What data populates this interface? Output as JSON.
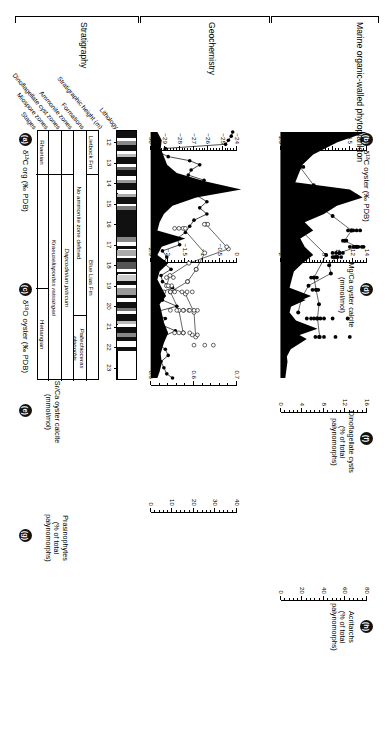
{
  "figure": {
    "groups": [
      {
        "id": "stratigraphy",
        "label": "Stratigraphy"
      },
      {
        "id": "geochemistry",
        "label": "Geochemistry"
      },
      {
        "id": "phytoplankton",
        "label": "Marine organic-walled phytoplankton"
      }
    ],
    "column_headers": [
      "Stages",
      "Miospore zones",
      "Dinoflagellate cyst zones",
      "Ammonite zones",
      "Formations",
      "Stratigraphic height (m)",
      "Lithology"
    ],
    "stratigraphy_table": {
      "rows": [
        {
          "name": "formations",
          "cells": [
            {
              "label": "Lietbock Fm",
              "italic": false,
              "span": [
                0,
                0.175
              ]
            },
            {
              "label": "Blue Lias Fm",
              "italic": false,
              "span": [
                0.175,
                1.0
              ]
            }
          ]
        },
        {
          "name": "ammonite-zones",
          "cells": [
            {
              "label": "No ammonite zone defined",
              "italic": false,
              "span": [
                0,
                0.74
              ]
            },
            {
              "label": "Paltechioceras planorbis",
              "italic": true,
              "span": [
                0.74,
                1.0
              ]
            }
          ]
        },
        {
          "name": "dinoflagellate-cyst-zones",
          "cells": [
            {
              "label": "",
              "italic": false,
              "span": [
                0,
                0.175
              ]
            },
            {
              "label": "Dapcodinium priscum",
              "italic": true,
              "span": [
                0.175,
                1.0
              ]
            }
          ]
        },
        {
          "name": "miospore-zones",
          "cells": [
            {
              "label": "",
              "italic": false,
              "span": [
                0,
                0.175
              ]
            },
            {
              "label": "Kraeuselisporites reissingeri",
              "italic": true,
              "span": [
                0.175,
                1.0
              ]
            }
          ]
        },
        {
          "name": "stages",
          "cells": [
            {
              "label": "Rhaetian",
              "italic": false,
              "span": [
                0,
                0.175
              ]
            },
            {
              "label": "",
              "italic": false,
              "span": [
                0.175,
                0.63
              ]
            },
            {
              "label": "Hettangian",
              "italic": false,
              "span": [
                0.63,
                1.0
              ]
            }
          ]
        }
      ]
    },
    "height_axis": {
      "label": "Stratigraphic height (m)",
      "ticks": [
        12,
        13,
        14,
        15,
        16,
        17,
        18,
        19,
        20,
        21,
        22,
        23
      ],
      "min": 11.4,
      "max": 23.6
    },
    "panels": [
      {
        "key": "a",
        "letter": "a",
        "title": [
          "δ¹³ C",
          "org",
          "(‰ PDB)"
        ],
        "title_plain": "δ¹³C org (‰ PDB)",
        "ticks": [
          -30,
          -29,
          -28,
          -27,
          -26,
          -25,
          -24
        ],
        "tick_labels": [
          "−30",
          "−29",
          "−28",
          "−27",
          "−26",
          "−25",
          "−24"
        ],
        "style": "line-filled"
      },
      {
        "key": "b",
        "letter": "b",
        "title": [
          "δ¹³ C",
          "oyster",
          "(‰ PDB)"
        ],
        "title_plain": "δ¹³C oyster (‰ PDB)",
        "ticks": [
          1.5,
          2,
          2.5,
          3,
          3.5,
          4
        ],
        "tick_labels": [
          "1.5",
          "2",
          "2.5",
          "3",
          "3.5",
          "4"
        ],
        "style": "line-filled"
      },
      {
        "key": "c",
        "letter": "c",
        "title": [
          "δ¹⁸ O",
          "oyster",
          "(‰ PDB)"
        ],
        "title_plain": "δ¹⁸O oyster (‰ PDB)",
        "ticks": [
          0,
          -0.5,
          -1,
          -1.5,
          -2,
          -2.5
        ],
        "tick_labels": [
          "0",
          "−0.5",
          "−1",
          "−1.5",
          "−2",
          "−2.5"
        ],
        "style": "line-open"
      },
      {
        "key": "d",
        "letter": "d",
        "title": [
          "Mg/Ca oyster calcite",
          "(mmol/mol)"
        ],
        "title_plain": "Mg/Ca oyster calcite (mmol/mol)",
        "ticks": [
          2,
          4,
          6,
          8,
          10,
          12,
          14
        ],
        "tick_labels": [
          "2",
          "4",
          "6",
          "8",
          "10",
          "12",
          "14"
        ],
        "style": "line-filled"
      },
      {
        "key": "e",
        "letter": "e",
        "title": [
          "Sr/Ca oyster calcite",
          "(mmol/mol)"
        ],
        "title_plain": "Sr/Ca oyster calcite (mmol/mol)",
        "ticks": [
          0.5,
          0.6,
          0.7
        ],
        "tick_labels": [
          "0.5",
          "0.6",
          "0.7"
        ],
        "style": "line-open"
      },
      {
        "key": "f",
        "letter": "f",
        "title": [
          "Dinoflagellate cysts",
          "(% of total",
          "palynomorphs)"
        ],
        "title_plain": "Dinoflagellate cysts (% of total palynomorphs)",
        "ticks": [
          0,
          4,
          8,
          12,
          16
        ],
        "tick_labels": [
          "0",
          "4",
          "8",
          "12",
          "16"
        ],
        "style": "area"
      },
      {
        "key": "g",
        "letter": "g",
        "title": [
          "Prasinophytes",
          "(% of total",
          "palynomorphs)"
        ],
        "title_plain": "Prasinophytes (% of total palynomorphs)",
        "ticks": [
          0,
          10,
          20,
          30,
          40
        ],
        "tick_labels": [
          "0",
          "10",
          "20",
          "30",
          "40"
        ],
        "style": "area"
      },
      {
        "key": "h",
        "letter": "h",
        "title": [
          "Acritarchs",
          "(% of total",
          "palynomorphs)"
        ],
        "title_plain": "Acritarchs (% of total palynomorphs)",
        "ticks": [
          0,
          20,
          40,
          60,
          80
        ],
        "tick_labels": [
          "0",
          "20",
          "40",
          "60",
          "80"
        ],
        "style": "area"
      }
    ]
  },
  "chart_data": [
    {
      "id": "a",
      "type": "line",
      "title": "δ¹³C org (‰ PDB)",
      "xlabel": "Stratigraphic height (m)",
      "ylabel": "δ¹³C org (‰ PDB)",
      "ylim": [
        -30,
        -23.6
      ],
      "xlim": [
        11.4,
        23.6
      ],
      "marker": "filled-circle",
      "x": [
        11.5,
        11.7,
        11.9,
        12.1,
        12.3,
        12.5,
        12.7,
        12.9,
        13.1,
        13.35,
        13.6,
        13.85,
        14.1,
        14.35,
        14.6,
        14.9,
        15.2,
        15.5,
        15.8,
        16.1,
        16.4,
        16.7,
        17.0,
        17.3,
        17.6,
        17.9,
        18.2,
        18.5,
        18.8,
        19.1,
        19.4,
        19.7,
        20.0,
        20.3,
        20.6,
        20.9,
        21.2,
        21.5,
        21.8,
        22.1,
        22.4,
        22.7,
        23.0,
        23.3,
        23.5
      ],
      "y": [
        -24.3,
        -24.4,
        -24.6,
        -24.8,
        -29.0,
        -29.4,
        -28.8,
        -27.3,
        -26.6,
        -27.2,
        -27.4,
        -26.3,
        -26.7,
        -26.2,
        -26.8,
        -26.1,
        -26.6,
        -26.1,
        -27.0,
        -27.3,
        -27.6,
        -28.2,
        -28.0,
        -29.2,
        -28.9,
        -29.1,
        -28.6,
        -29.3,
        -29.2,
        -28.5,
        -29.6,
        -29.2,
        -28.2,
        -29.8,
        -29.0,
        -29.3,
        -28.3,
        -29.2,
        -29.6,
        -29.0,
        -28.8,
        -29.3,
        -29.1,
        -28.9,
        -28.5
      ]
    },
    {
      "id": "b",
      "type": "scatter-line",
      "title": "δ¹³C oyster (‰ PDB)",
      "ylabel": "δ¹³C oyster (‰ PDB)",
      "xlim": [
        11.4,
        23.6
      ],
      "ylim": [
        1.5,
        4.1
      ],
      "marker": "filled-circle",
      "series_line": {
        "x": [
          12.0,
          13.2,
          14.1,
          15.0,
          15.6,
          16.3,
          16.8,
          17.1,
          17.4,
          17.6,
          18.0,
          18.4,
          19.0,
          19.6,
          20.3
        ],
        "y": [
          2.6,
          2.05,
          2.45,
          2.5,
          3.0,
          3.55,
          3.35,
          3.7,
          3.2,
          3.1,
          2.9,
          2.95,
          2.3,
          2.1,
          2.0
        ]
      },
      "scatter": {
        "x": [
          12.0,
          12.0,
          13.2,
          13.2,
          16.3,
          16.3,
          16.3,
          16.3,
          16.3,
          16.8,
          16.8,
          17.1,
          17.1,
          17.1,
          17.1,
          17.1,
          17.1,
          17.1,
          17.4,
          17.4,
          17.4,
          17.4,
          17.6,
          17.6,
          17.6,
          17.6
        ],
        "y": [
          2.55,
          2.7,
          2.0,
          2.15,
          3.45,
          3.55,
          3.6,
          3.7,
          3.8,
          3.3,
          3.4,
          3.5,
          3.6,
          3.65,
          3.7,
          3.75,
          3.85,
          3.9,
          3.0,
          3.1,
          3.2,
          3.3,
          3.0,
          3.05,
          3.15,
          3.25
        ]
      }
    },
    {
      "id": "c",
      "type": "scatter-line",
      "title": "δ¹⁸O oyster (‰ PDB)",
      "ylabel": "δ¹⁸O oyster (‰ PDB)",
      "xlim": [
        11.4,
        23.6
      ],
      "ylim": [
        -2.6,
        0.1
      ],
      "marker": "open-circle",
      "series_line": {
        "x": [
          16.0,
          17.2,
          17.9,
          18.5,
          19.0,
          19.4,
          20.3,
          21.5
        ],
        "y": [
          -0.9,
          -0.25,
          -1.4,
          -1.95,
          -2.05,
          -1.5,
          -1.25,
          -1.2
        ]
      },
      "scatter": {
        "x": [
          21.4,
          21.4,
          20.2,
          20.2,
          20.2,
          20.2,
          19.3,
          19.3,
          19.3,
          19.0,
          19.0,
          18.6,
          18.6,
          17.1,
          16.0,
          16.0
        ],
        "y": [
          -1.15,
          -1.3,
          -1.15,
          -1.25,
          -1.4,
          -1.55,
          -1.3,
          -1.45,
          -1.6,
          -1.9,
          -2.0,
          -1.85,
          -2.05,
          -0.3,
          -0.85,
          -0.95
        ]
      }
    },
    {
      "id": "d",
      "type": "scatter-line",
      "title": "Mg/Ca oyster calcite (mmol/mol)",
      "ylabel": "Mg/Ca oyster calcite (mmol/mol)",
      "xlim": [
        11.4,
        23.6
      ],
      "ylim": [
        1.6,
        14.6
      ],
      "marker": "filled-circle",
      "series_line": {
        "x": [
          16.1,
          17.5,
          18.6,
          19.2,
          19.9,
          20.6,
          21.5
        ],
        "y": [
          4.2,
          8.3,
          6.6,
          6.9,
          7.3,
          7.1,
          7.4
        ]
      },
      "scatter": {
        "x": [
          16.1,
          16.1,
          18.6,
          18.6,
          18.6,
          19.2,
          19.2,
          19.2,
          20.6,
          20.6,
          20.6,
          20.6,
          20.6,
          20.6,
          20.6,
          20.6,
          21.5,
          21.5,
          21.5,
          21.5,
          21.5
        ],
        "y": [
          4.0,
          4.4,
          6.2,
          6.6,
          7.0,
          6.4,
          6.9,
          7.2,
          5.6,
          6.2,
          6.6,
          7.0,
          7.5,
          8.0,
          9.2,
          11.3,
          6.8,
          7.3,
          8.0,
          9.6,
          11.6
        ]
      }
    },
    {
      "id": "e",
      "type": "scatter-line",
      "title": "Sr/Ca oyster calcite (mmol/mol)",
      "ylabel": "Sr/Ca oyster calcite (mmol/mol)",
      "xlim": [
        11.4,
        23.6
      ],
      "ylim": [
        0.46,
        0.73
      ],
      "marker": "open-circle",
      "series_line": {
        "x": [
          16.2,
          17.4,
          18.2,
          18.8,
          19.3,
          20.2,
          21.3
        ],
        "y": [
          0.575,
          0.625,
          0.605,
          0.585,
          0.545,
          0.565,
          0.575
        ]
      },
      "scatter": {
        "x": [
          16.2,
          16.2,
          16.2,
          18.2,
          18.8,
          19.3,
          19.3,
          19.3,
          20.2,
          20.2,
          20.2,
          20.2,
          21.3,
          21.3,
          21.3,
          21.3,
          21.9,
          21.9,
          21.9
        ],
        "y": [
          0.555,
          0.565,
          0.58,
          0.605,
          0.585,
          0.53,
          0.545,
          0.555,
          0.545,
          0.56,
          0.575,
          0.59,
          0.555,
          0.565,
          0.575,
          0.59,
          0.6,
          0.625,
          0.645
        ]
      }
    },
    {
      "id": "f",
      "type": "area",
      "title": "Dinoflagellate cysts (% of total palynomorphs)",
      "ylabel": "% of total palynomorphs",
      "xlim": [
        11.4,
        23.6
      ],
      "ylim": [
        0,
        17
      ],
      "x": [
        11.5,
        12.0,
        12.6,
        13.1,
        13.6,
        14.0,
        14.4,
        14.9,
        15.3,
        15.7,
        16.1,
        16.5,
        16.9,
        17.3,
        17.7,
        18.1,
        18.5,
        18.9,
        19.3,
        19.7,
        20.1,
        20.5,
        21.0,
        21.6,
        22.1,
        22.6,
        23.1,
        23.5
      ],
      "y": [
        16.0,
        10.5,
        6.0,
        4.0,
        3.2,
        2.6,
        2.2,
        1.8,
        1.4,
        1.1,
        0.8,
        0.6,
        0.5,
        0.4,
        0.4,
        0.4,
        0.5,
        1.4,
        0.5,
        4.6,
        1.2,
        0.6,
        0.6,
        4.8,
        1.8,
        0.8,
        0.6,
        0.4
      ]
    },
    {
      "id": "g",
      "type": "area",
      "title": "Prasinophytes (% of total palynomorphs)",
      "ylabel": "% of total palynomorphs",
      "xlim": [
        11.4,
        23.6
      ],
      "ylim": [
        0,
        45
      ],
      "x": [
        11.5,
        11.9,
        12.3,
        12.7,
        13.1,
        13.5,
        13.9,
        14.3,
        14.7,
        15.1,
        15.5,
        15.9,
        16.3,
        16.7,
        17.1,
        17.5,
        17.9,
        18.3,
        18.7,
        19.1,
        19.5,
        19.9,
        20.3,
        20.8,
        21.3,
        21.8,
        22.3,
        22.8,
        23.2,
        23.5
      ],
      "y": [
        3.0,
        5.0,
        4.5,
        6.0,
        7.5,
        12.0,
        25.0,
        42.0,
        21.0,
        10.0,
        6.0,
        4.0,
        3.0,
        16.0,
        5.0,
        3.0,
        8.0,
        4.0,
        3.0,
        5.0,
        7.0,
        4.0,
        5.0,
        6.0,
        8.0,
        6.0,
        4.5,
        5.0,
        4.0,
        3.0
      ]
    },
    {
      "id": "h",
      "type": "area",
      "title": "Acritarchs (% of total palynomorphs)",
      "ylabel": "% of total palynomorphs",
      "xlim": [
        11.4,
        23.6
      ],
      "ylim": [
        0,
        85
      ],
      "x": [
        11.5,
        11.9,
        12.3,
        12.7,
        13.1,
        13.5,
        13.9,
        14.3,
        14.7,
        15.1,
        15.5,
        15.9,
        16.3,
        16.7,
        17.1,
        17.5,
        17.9,
        18.3,
        18.7,
        19.1,
        19.5,
        19.9,
        20.3,
        20.7,
        21.1,
        21.5,
        21.9,
        22.3,
        22.7,
        23.1,
        23.5
      ],
      "y": [
        4.0,
        4.0,
        4.5,
        5.0,
        5.0,
        5.5,
        6.0,
        64.0,
        76.0,
        52.0,
        40.0,
        22.0,
        30.0,
        18.0,
        22.0,
        30.0,
        20.0,
        12.0,
        10.0,
        8.0,
        28.0,
        10.0,
        8.0,
        14.0,
        34.0,
        12.0,
        6.0,
        5.0,
        6.0,
        5.0,
        4.0
      ]
    }
  ]
}
